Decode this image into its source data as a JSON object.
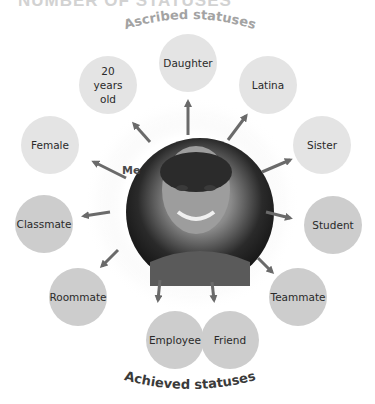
{
  "header": {
    "title_partial": "NUMBER OF STATUSES"
  },
  "diagram": {
    "center_label": "Me",
    "ascribed_heading": "Ascribed statuses",
    "achieved_heading": "Achieved statuses",
    "colors": {
      "ascribed_fill": "#e4e4e4",
      "achieved_fill": "#cdcdcd",
      "arrow": "#6a6a6a",
      "ascribed_heading": "#a3a3a3",
      "achieved_heading": "#3a3a3a"
    },
    "nodes": [
      {
        "label": "Daughter",
        "type": "ascribed"
      },
      {
        "label": "Latina",
        "type": "ascribed"
      },
      {
        "label": "Sister",
        "type": "ascribed"
      },
      {
        "label": "Student",
        "type": "achieved"
      },
      {
        "label": "Teammate",
        "type": "achieved"
      },
      {
        "label": "Friend",
        "type": "achieved"
      },
      {
        "label": "Employee",
        "type": "achieved"
      },
      {
        "label": "Roommate",
        "type": "achieved"
      },
      {
        "label": "Classmate",
        "type": "achieved"
      },
      {
        "label": "Female",
        "type": "ascribed"
      },
      {
        "label": "20 years old",
        "type": "ascribed"
      }
    ]
  }
}
